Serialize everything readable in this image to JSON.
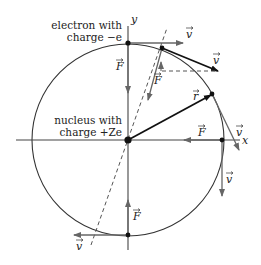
{
  "diagram": {
    "labels": {
      "electron_line1": "electron with",
      "electron_line2": "charge −e",
      "nucleus_line1": "nucleus with",
      "nucleus_line2": "charge +Ze",
      "axis_x": "x",
      "axis_y": "y",
      "force": "F",
      "velocity": "v",
      "radius": "r"
    },
    "colors": {
      "circle": "#333333",
      "axes": "#444444",
      "vector_gray": "#666666",
      "vector_black": "#111111",
      "dashed": "#555555"
    }
  }
}
